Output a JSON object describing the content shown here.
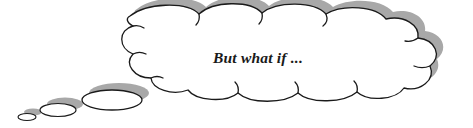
{
  "figure": {
    "type": "thought-bubble-illustration",
    "caption_text": "But what if ...",
    "background_color": "#ffffff",
    "outline_color": "#1a1a1a",
    "shadow_color": "#a8a8a8",
    "fill_color": "#ffffff",
    "text_color": "#1a1a1a",
    "canvas": {
      "width": 473,
      "height": 128
    }
  },
  "bubble": {
    "name": "main-thought-cloud",
    "scallop_count": 11,
    "shadow_offset": {
      "x": 5,
      "y": -7
    }
  },
  "trail": {
    "bubbles": [
      {
        "name": "trail-bubble-large",
        "cx": 112,
        "cy": 100,
        "rx": 30,
        "ry": 10
      },
      {
        "name": "trail-bubble-medium",
        "cx": 58,
        "cy": 110,
        "rx": 18,
        "ry": 6.5
      },
      {
        "name": "trail-bubble-small",
        "cx": 27,
        "cy": 117,
        "rx": 9,
        "ry": 3.5
      }
    ]
  }
}
